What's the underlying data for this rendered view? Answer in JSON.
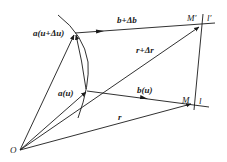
{
  "diagram": {
    "points": {
      "origin": {
        "label": "O",
        "x": 20,
        "y": 150
      },
      "a_u_du": {
        "label": "a(u+Δu)",
        "x": 75,
        "y": 33
      },
      "a_u": {
        "label": "a(u)",
        "x": 87,
        "y": 91
      },
      "M_prime": {
        "label": "M′",
        "x": 200,
        "y": 26
      },
      "M": {
        "label": "M",
        "x": 192,
        "y": 104
      }
    },
    "labels": {
      "a_u_du": "a(u+Δu)",
      "a_u": "a(u)",
      "b_db": "b+Δb",
      "b_u": "b(u)",
      "r_dr": "r+Δr",
      "r": "r",
      "M_prime": "M′",
      "M": "M",
      "l_prime": "l′",
      "l": "l",
      "O": "O"
    },
    "colors": {
      "stroke": "#1a1a1a",
      "background": "#ffffff"
    }
  }
}
